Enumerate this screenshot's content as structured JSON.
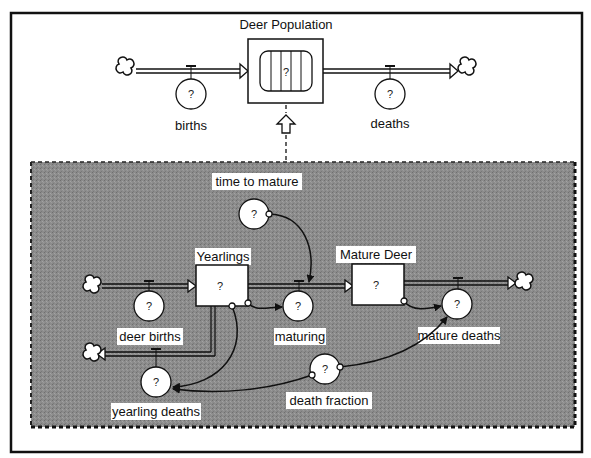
{
  "diagram": {
    "type": "stock-and-flow",
    "top_model": {
      "stock": {
        "label": "Deer Population",
        "value": "?"
      },
      "inflow": {
        "label": "births",
        "value": "?"
      },
      "outflow": {
        "label": "deaths",
        "value": "?"
      }
    },
    "submodel": {
      "stocks": [
        {
          "label": "Yearlings",
          "value": "?"
        },
        {
          "label": "Mature Deer",
          "value": "?"
        }
      ],
      "flows": [
        {
          "label": "deer births",
          "value": "?"
        },
        {
          "label": "maturing",
          "value": "?"
        },
        {
          "label": "mature deaths",
          "value": "?"
        },
        {
          "label": "yearling deaths",
          "value": "?"
        }
      ],
      "converters": [
        {
          "label": "time to mature",
          "value": "?"
        },
        {
          "label": "death fraction",
          "value": "?"
        }
      ]
    },
    "colors": {
      "panel": "#8a8a8a",
      "line": "#111111",
      "background": "#ffffff"
    }
  }
}
